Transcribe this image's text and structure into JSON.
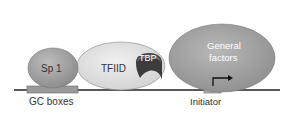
{
  "diagram": {
    "proteins": {
      "sp1": "Sp 1",
      "tfiid": "TFIID",
      "tbp": "TBP",
      "general_factors_line1": "General",
      "general_factors_line2": "factors"
    },
    "dna_elements": {
      "gc_boxes": "GC boxes",
      "initiator": "Initiator"
    },
    "colors": {
      "protein_fill": "#a8a8a8",
      "tfiid_fill": "#e2e2e2",
      "tbp_fill": "#4a4a4a",
      "dna_line": "#222222",
      "box_fill": "#9a9a9a"
    }
  }
}
